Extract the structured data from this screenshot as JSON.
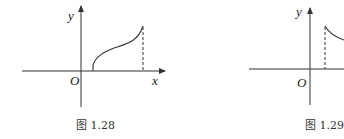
{
  "figures": [
    {
      "caption": "图 1.28",
      "labels": {
        "y_axis": "y",
        "x_axis": "x",
        "origin": "O"
      },
      "curve": "increasing S-shaped curve starting just right of origin, dashed vertical at right endpoint"
    },
    {
      "caption": "图 1.29",
      "labels": {
        "y_axis": "y",
        "origin": "O"
      },
      "curve": "decreasing curve starting at dashed vertical right of y-axis (cropped)"
    }
  ],
  "colors": {
    "stroke": "#333333",
    "background": "#ffffff"
  }
}
